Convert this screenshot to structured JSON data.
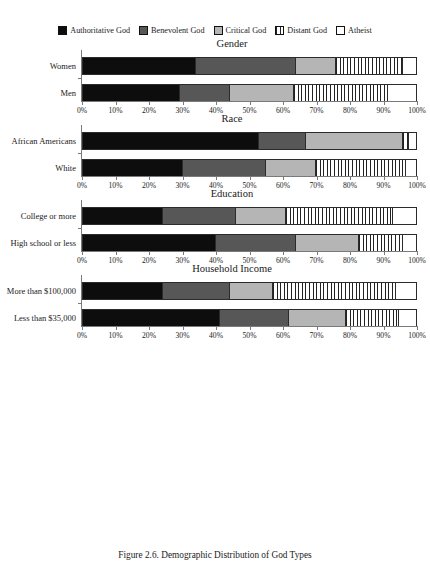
{
  "caption": "Figure 2.6. Demographic Distribution of God Types",
  "legend": {
    "items": [
      {
        "label": "Authoritative God",
        "color": "#0d0d0d",
        "pattern": "solid",
        "icon": "legend-swatch-authoritative"
      },
      {
        "label": "Benevolent God",
        "color": "#575757",
        "pattern": "solid",
        "icon": "legend-swatch-benevolent"
      },
      {
        "label": "Critical God",
        "color": "#b5b5b5",
        "pattern": "solid",
        "icon": "legend-swatch-critical"
      },
      {
        "label": "Distant God",
        "color": "#ffffff",
        "pattern": "vstripe",
        "icon": "legend-swatch-distant"
      },
      {
        "label": "Atheist",
        "color": "#ffffff",
        "pattern": "solid",
        "icon": "legend-swatch-atheist"
      }
    ]
  },
  "axis": {
    "ticks": [
      "0%",
      "10%",
      "20%",
      "30%",
      "40%",
      "50%",
      "60%",
      "70%",
      "80%",
      "90%",
      "100%"
    ],
    "min": 0,
    "max": 100
  },
  "chart_data": {
    "type": "bar",
    "orientation": "horizontal",
    "stacked": true,
    "normalized": true,
    "title": "Figure 2.6. Demographic Distribution of God Types",
    "xlabel": "",
    "ylabel": "",
    "xlim": [
      0,
      100
    ],
    "grid": false,
    "legend_position": "top",
    "series": [
      {
        "name": "Authoritative God",
        "color": "#0d0d0d",
        "pattern": "solid"
      },
      {
        "name": "Benevolent God",
        "color": "#575757",
        "pattern": "solid"
      },
      {
        "name": "Critical God",
        "color": "#b5b5b5",
        "pattern": "solid"
      },
      {
        "name": "Distant God",
        "color": "#ffffff",
        "pattern": "vstripe"
      },
      {
        "name": "Atheist",
        "color": "#ffffff",
        "pattern": "solid"
      }
    ],
    "panels": [
      {
        "title": "Gender",
        "categories": [
          "Women",
          "Men"
        ],
        "values": [
          [
            34.0,
            30.0,
            12.0,
            20.0,
            4.0
          ],
          [
            29.0,
            15.0,
            19.5,
            28.0,
            8.5
          ]
        ]
      },
      {
        "title": "Race",
        "categories": [
          "African Americans",
          "White"
        ],
        "values": [
          [
            53.0,
            14.0,
            29.0,
            2.0,
            2.0
          ],
          [
            30.0,
            25.0,
            15.0,
            27.0,
            3.0
          ]
        ]
      },
      {
        "title": "Education",
        "categories": [
          "College or more",
          "High school or less"
        ],
        "values": [
          [
            24.0,
            22.0,
            15.0,
            32.0,
            7.0
          ],
          [
            40.0,
            24.0,
            19.0,
            13.0,
            4.0
          ]
        ]
      },
      {
        "title": "Household Income",
        "categories": [
          "More than $100,000",
          "Less than $35,000"
        ],
        "values": [
          [
            24.0,
            20.0,
            13.0,
            37.0,
            6.0
          ],
          [
            41.0,
            21.0,
            17.0,
            16.0,
            5.0
          ]
        ]
      }
    ]
  }
}
